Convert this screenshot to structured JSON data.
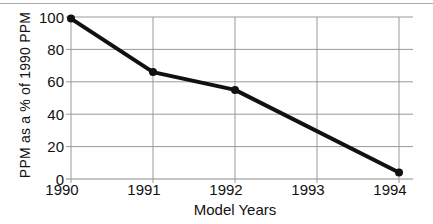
{
  "figure": {
    "background": "#ffffff"
  },
  "chart_data": {
    "type": "line",
    "title": "",
    "xlabel": "Model Years",
    "ylabel": "PPM as a % of 1990 PPM",
    "xlim": [
      1990,
      1994
    ],
    "ylim": [
      0,
      100
    ],
    "xticks": [
      1990,
      1991,
      1992,
      1993,
      1994
    ],
    "yticks": [
      0,
      20,
      40,
      60,
      80,
      100
    ],
    "grid": true,
    "legend": false,
    "series": [
      {
        "name": "PPM as % of 1990 PPM",
        "points": [
          {
            "x": 1990,
            "y": 99
          },
          {
            "x": 1991,
            "y": 66
          },
          {
            "x": 1992,
            "y": 55
          },
          {
            "x": 1994,
            "y": 4
          }
        ],
        "note_unmarked_value": {
          "x": 1993,
          "y": 30
        }
      }
    ],
    "colors": {
      "line": "#111111",
      "marker": "#111111",
      "grid": "#999999",
      "axis": "#8a8a8a",
      "text": "#111111"
    }
  }
}
